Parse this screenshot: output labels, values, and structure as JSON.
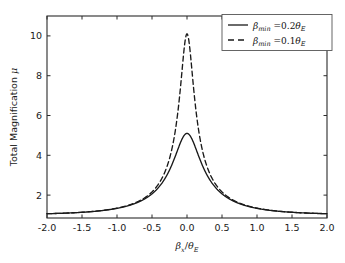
{
  "chart_data": {
    "type": "line",
    "title": "",
    "xlabel": "βₓ/θᴇ",
    "ylabel": "Total Magnification μ",
    "xlim": [
      -2.0,
      2.0
    ],
    "ylim": [
      0.85,
      11.0
    ],
    "xticks": [
      -2.0,
      -1.5,
      -1.0,
      -0.5,
      0.0,
      0.5,
      1.0,
      1.5,
      2.0
    ],
    "xtick_labels": [
      "-2.0",
      "-1.5",
      "-1.0",
      "-0.5",
      "0.0",
      "0.5",
      "1.0",
      "1.5",
      "2.0"
    ],
    "yticks": [
      2,
      4,
      6,
      8,
      10
    ],
    "ytick_labels": [
      "2",
      "4",
      "6",
      "8",
      "10"
    ],
    "grid": false,
    "legend_position": "upper right",
    "series": [
      {
        "name": "βmin = 0.2θE",
        "style": "solid",
        "color": "#1a1a1a",
        "beta_min": 0.2,
        "peak_value": 5.1,
        "x": [
          -2.0,
          -1.9,
          -1.8,
          -1.7,
          -1.6,
          -1.5,
          -1.4,
          -1.3,
          -1.2,
          -1.1,
          -1.0,
          -0.9,
          -0.8,
          -0.7,
          -0.6,
          -0.5,
          -0.45,
          -0.4,
          -0.35,
          -0.3,
          -0.25,
          -0.2,
          -0.15,
          -0.1,
          -0.05,
          0.0,
          0.05,
          0.1,
          0.15,
          0.2,
          0.25,
          0.3,
          0.35,
          0.4,
          0.45,
          0.5,
          0.6,
          0.7,
          0.8,
          0.9,
          1.0,
          1.1,
          1.2,
          1.3,
          1.4,
          1.5,
          1.6,
          1.7,
          1.8,
          1.9,
          2.0
        ],
        "y": [
          1.07,
          1.08,
          1.1,
          1.12,
          1.15,
          1.18,
          1.22,
          1.27,
          1.33,
          1.41,
          1.51,
          1.64,
          1.81,
          2.02,
          2.3,
          2.67,
          2.89,
          3.14,
          3.41,
          3.69,
          3.99,
          4.28,
          4.55,
          4.79,
          4.97,
          5.1,
          4.97,
          4.79,
          4.55,
          4.28,
          3.99,
          3.69,
          3.41,
          3.14,
          2.89,
          2.67,
          2.3,
          2.02,
          1.81,
          1.64,
          1.51,
          1.41,
          1.33,
          1.27,
          1.22,
          1.18,
          1.15,
          1.12,
          1.1,
          1.08,
          1.07
        ]
      },
      {
        "name": "βmin = 0.1θE",
        "style": "dashed",
        "color": "#1a1a1a",
        "beta_min": 0.1,
        "peak_value": 10.1,
        "x": [
          -2.0,
          -1.9,
          -1.8,
          -1.7,
          -1.6,
          -1.5,
          -1.4,
          -1.3,
          -1.2,
          -1.1,
          -1.0,
          -0.9,
          -0.8,
          -0.7,
          -0.6,
          -0.5,
          -0.45,
          -0.4,
          -0.35,
          -0.3,
          -0.25,
          -0.2,
          -0.15,
          -0.1,
          -0.075,
          -0.05,
          -0.025,
          0.0,
          0.025,
          0.05,
          0.075,
          0.1,
          0.15,
          0.2,
          0.25,
          0.3,
          0.35,
          0.4,
          0.45,
          0.5,
          0.6,
          0.7,
          0.8,
          0.9,
          1.0,
          1.1,
          1.2,
          1.3,
          1.4,
          1.5,
          1.6,
          1.7,
          1.8,
          1.9,
          2.0
        ],
        "y": [
          1.07,
          1.08,
          1.1,
          1.12,
          1.14,
          1.17,
          1.21,
          1.26,
          1.32,
          1.4,
          1.5,
          1.63,
          1.79,
          2.01,
          2.3,
          2.7,
          2.95,
          3.25,
          3.61,
          4.05,
          4.59,
          5.26,
          6.09,
          7.12,
          7.7,
          8.33,
          8.96,
          10.1,
          8.96,
          8.33,
          7.7,
          7.12,
          6.09,
          5.26,
          4.59,
          4.05,
          3.61,
          3.25,
          2.95,
          2.7,
          2.3,
          2.01,
          1.79,
          1.63,
          1.5,
          1.4,
          1.32,
          1.26,
          1.21,
          1.17,
          1.14,
          1.12,
          1.1,
          1.08,
          1.07
        ]
      }
    ],
    "legend_entries": [
      {
        "symbol": "β",
        "subscript": "min",
        "equals": "=0.2",
        "theta": "θ",
        "theta_sub": "E"
      },
      {
        "symbol": "β",
        "subscript": "min",
        "equals": "=0.1",
        "theta": "θ",
        "theta_sub": "E"
      }
    ]
  },
  "axis": {
    "ylabel_main": "Total Magnification",
    "ylabel_symbol": "μ",
    "xlabel_beta": "β",
    "xlabel_beta_sub": "x",
    "xlabel_slash": "/",
    "xlabel_theta": "θ",
    "xlabel_theta_sub": "E"
  }
}
